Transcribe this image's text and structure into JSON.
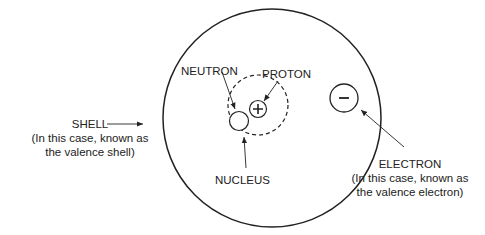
{
  "diagram": {
    "labels": {
      "neutron": "NEUTRON",
      "proton": "PROTON",
      "nucleus": "NUCLEUS",
      "shell_title": "SHELL",
      "shell_note_1": "(In this case, known as",
      "shell_note_2": "the valence shell)",
      "electron_title": "ELECTRON",
      "electron_note_1": "(In this case, known as",
      "electron_note_2": "the valence electron)"
    },
    "symbols": {
      "proton": "+",
      "electron": "−"
    },
    "colors": {
      "stroke": "#222222",
      "background": "#ffffff"
    }
  }
}
